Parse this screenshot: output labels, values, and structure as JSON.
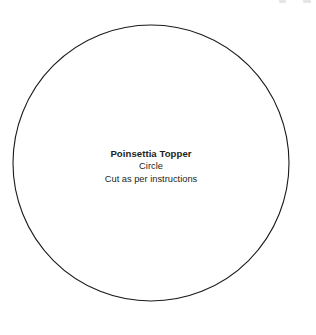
{
  "page": {
    "background_color": "#ffffff"
  },
  "template": {
    "shape_name": "circle-outline",
    "stroke_color": "#1a1a1a",
    "fill_color": "#ffffff",
    "center_x": 151,
    "center_y": 163,
    "radius": 138
  },
  "label": {
    "title": "Poinsettia Topper",
    "shape": "Circle",
    "instruction": "Cut as per instructions",
    "text_color": "#231f20"
  },
  "top_marks": [
    {
      "name": "clipped-mark-left"
    },
    {
      "name": "clipped-mark-right"
    }
  ]
}
